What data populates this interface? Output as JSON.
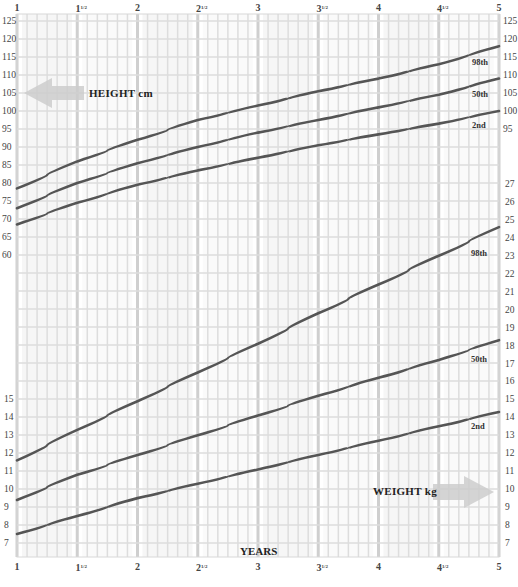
{
  "chart_data": {
    "type": "line",
    "title": "",
    "xlabel": "YEARS",
    "x_ticks": [
      "1",
      "1½",
      "2",
      "2½",
      "3",
      "3½",
      "4",
      "4½",
      "5"
    ],
    "x_tick_values": [
      1,
      1.5,
      2,
      2.5,
      3,
      3.5,
      4,
      4.5,
      5
    ],
    "xlim": [
      1,
      5
    ],
    "grid": true,
    "charts": [
      {
        "name": "HEIGHT cm",
        "ylabel": "HEIGHT cm",
        "ylim": [
          55,
          125
        ],
        "left_ticks": [
          125,
          120,
          115,
          110,
          105,
          100,
          95,
          90,
          85,
          80,
          75,
          70,
          65,
          60
        ],
        "right_ticks": [
          125,
          120,
          115,
          110,
          105,
          100,
          95
        ],
        "x": [
          1,
          1.5,
          2,
          2.5,
          3,
          3.5,
          4,
          4.5,
          5
        ],
        "series": [
          {
            "name": "98th",
            "values": [
              78.5,
              86,
              92,
              97.5,
              101.5,
              105.5,
              109,
              113,
              118
            ]
          },
          {
            "name": "50th",
            "values": [
              73,
              80,
              85.5,
              90,
              94,
              97.5,
              101,
              104.5,
              109
            ]
          },
          {
            "name": "2nd",
            "values": [
              68.5,
              74.5,
              79.5,
              83.5,
              87,
              90.5,
              93.5,
              96.5,
              100
            ]
          }
        ]
      },
      {
        "name": "WEIGHT kg",
        "ylabel": "WEIGHT kg",
        "ylim": [
          6,
          27
        ],
        "left_ticks": [
          15,
          14,
          13,
          12,
          11,
          10,
          9,
          8,
          7
        ],
        "right_ticks": [
          27,
          26,
          25,
          24,
          23,
          22,
          21,
          20,
          19,
          18,
          17,
          16,
          15,
          14,
          13,
          12,
          11,
          10,
          9,
          8,
          7
        ],
        "x": [
          1,
          1.5,
          2,
          2.5,
          3,
          3.5,
          4,
          4.5,
          5
        ],
        "series": [
          {
            "name": "98th",
            "values": [
              11.6,
              13.3,
              14.9,
              16.5,
              18.1,
              19.8,
              21.4,
              23,
              24.6
            ]
          },
          {
            "name": "50th",
            "values": [
              9.4,
              10.8,
              11.9,
              13,
              14.1,
              15.2,
              16.2,
              17.2,
              18.3
            ]
          },
          {
            "name": "2nd",
            "values": [
              7.5,
              8.5,
              9.5,
              10.3,
              11.1,
              11.9,
              12.7,
              13.5,
              14.3
            ]
          }
        ]
      }
    ]
  },
  "labels": {
    "height_arrow": "HEIGHT cm",
    "weight_arrow": "WEIGHT kg",
    "years": "YEARS",
    "pct_98": "98th",
    "pct_50": "50th",
    "pct_2": "2nd"
  },
  "colors": {
    "curve": "#555555",
    "grid_minor": "#dddddd",
    "grid_major": "#cfcfcf",
    "band": "#f2f2f2",
    "arrow": "#cccccc"
  }
}
